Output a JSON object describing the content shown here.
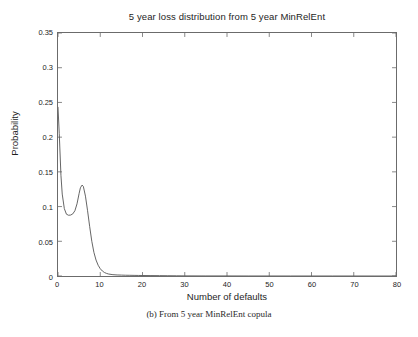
{
  "chart_data": {
    "type": "line",
    "title": "5 year loss distribution from 5 year MinRelEnt",
    "xlabel": "Number of defaults",
    "ylabel": "Probability",
    "xlim": [
      0,
      80
    ],
    "ylim": [
      0,
      0.35
    ],
    "grid": false,
    "legend": null,
    "xticks": [
      0,
      10,
      20,
      30,
      40,
      50,
      60,
      70,
      80
    ],
    "xtick_labels": [
      "0",
      "10",
      "20",
      "30",
      "40",
      "50",
      "60",
      "70",
      "80"
    ],
    "yticks": [
      0,
      0.05,
      0.1,
      0.15,
      0.2,
      0.25,
      0.3,
      0.35
    ],
    "ytick_labels": [
      "0",
      "0.05",
      "0.1",
      "0.15",
      "0.2",
      "0.25",
      "0.3",
      "0.35"
    ],
    "line_color": "#555555",
    "series": [
      {
        "name": "5 year MinRelEnt loss distribution",
        "x": [
          0,
          0.3,
          0.7,
          1,
          1.5,
          2,
          2.5,
          3,
          3.5,
          4,
          4.5,
          5,
          5.3,
          5.7,
          6,
          6.5,
          7,
          7.5,
          8,
          8.5,
          9,
          9.5,
          10,
          10.5,
          11,
          11.5,
          12,
          13,
          14,
          15,
          16,
          17,
          18,
          19,
          20,
          22,
          24,
          26,
          28,
          30,
          35,
          40,
          45,
          50,
          55,
          60,
          65,
          70,
          75,
          80
        ],
        "y": [
          0.243,
          0.205,
          0.145,
          0.118,
          0.097,
          0.089,
          0.0875,
          0.0878,
          0.0895,
          0.094,
          0.104,
          0.119,
          0.127,
          0.131,
          0.129,
          0.115,
          0.094,
          0.071,
          0.05,
          0.034,
          0.023,
          0.0155,
          0.0105,
          0.0072,
          0.005,
          0.0037,
          0.0028,
          0.0019,
          0.0015,
          0.0013,
          0.0011,
          0.001,
          0.0009,
          0.0008,
          0.0007,
          0.0006,
          0.0005,
          0.0004,
          0.0003,
          0.0002,
          0.0001,
          0.0001,
          5e-05,
          5e-05,
          2e-05,
          2e-05,
          1e-05,
          1e-05,
          5e-06,
          5e-06
        ]
      }
    ]
  },
  "caption": {
    "text": "(b) From 5 year MinRelEnt copula"
  }
}
